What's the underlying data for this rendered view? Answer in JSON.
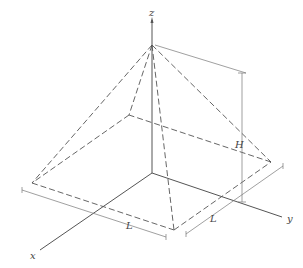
{
  "diagram": {
    "type": "pyramid-3d",
    "colors": {
      "axis": "#555555",
      "dashed": "#555555",
      "dimension": "#777777",
      "label": "#444444"
    },
    "axes": {
      "x": {
        "label": "x",
        "from": [
          152,
          173
        ],
        "to": [
          40,
          250
        ],
        "label_pos": [
          30,
          259
        ]
      },
      "y": {
        "label": "y",
        "from": [
          152,
          173
        ],
        "to": [
          282,
          217
        ],
        "label_pos": [
          287,
          222
        ]
      },
      "z": {
        "label": "z",
        "from": [
          152,
          173
        ],
        "to": [
          152,
          20
        ],
        "label_pos": [
          149,
          16
        ]
      }
    },
    "apex": [
      152,
      45
    ],
    "base_corners": {
      "left": [
        32,
        183
      ],
      "front": [
        174,
        230
      ],
      "right": [
        271,
        162
      ],
      "back": [
        129,
        115
      ]
    },
    "dimensions": {
      "H": {
        "label": "H",
        "line_x": 242,
        "top": 73,
        "bottom": 202,
        "label_pos": [
          236,
          146
        ]
      },
      "L_front": {
        "label": "L",
        "from": [
          22,
          190
        ],
        "to": [
          166,
          237
        ],
        "label_pos": [
          126,
          227
        ]
      },
      "L_side": {
        "label": "L",
        "from": [
          186,
          234
        ],
        "to": [
          283,
          166
        ],
        "label_pos": [
          211,
          221
        ]
      }
    }
  }
}
